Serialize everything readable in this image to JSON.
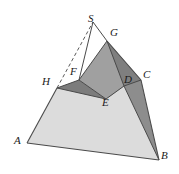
{
  "figure": {
    "type": "geometry-diagram",
    "background_color": "#ffffff",
    "stroke_color": "#4a4a4a",
    "label_color": "#1a1a1a",
    "face_colors": {
      "front_light": "#dcdcdc",
      "right_dark": "#8e8e8e",
      "upper_mid": "#9e9e9e",
      "cut_mid_dark": "#848484",
      "cut_left_dark": "#767676"
    },
    "labels": [
      {
        "id": "S",
        "text": "S",
        "x": 88,
        "y": 13
      },
      {
        "id": "G",
        "text": "G",
        "x": 110,
        "y": 27
      },
      {
        "id": "C",
        "text": "C",
        "x": 143,
        "y": 69
      },
      {
        "id": "D",
        "text": "D",
        "x": 124,
        "y": 74
      },
      {
        "id": "F",
        "text": "F",
        "x": 70,
        "y": 66
      },
      {
        "id": "H",
        "text": "H",
        "x": 42,
        "y": 76
      },
      {
        "id": "E",
        "text": "E",
        "x": 102,
        "y": 97
      },
      {
        "id": "A",
        "text": "A",
        "x": 14,
        "y": 135
      },
      {
        "id": "B",
        "text": "B",
        "x": 161,
        "y": 150
      }
    ],
    "points": {
      "S": [
        93,
        22
      ],
      "G": [
        107,
        41
      ],
      "C": [
        141,
        80
      ],
      "D": [
        124,
        86
      ],
      "F": [
        79,
        80
      ],
      "H": [
        57,
        88
      ],
      "E": [
        106,
        99
      ],
      "A": [
        27,
        143
      ],
      "B": [
        159,
        160
      ]
    },
    "faces": [
      {
        "name": "front-face-A-H-E-D-B",
        "fill": "#dcdcdc",
        "points": "27,143 57,88 79,80 106,99 124,86 159,160"
      },
      {
        "name": "right-face-C-D-B",
        "fill": "#8e8e8e",
        "points": "141,80 124,86 106,99 124,86 159,160"
      },
      {
        "name": "right-face-G-C-B",
        "fill": "#8a8a8a",
        "points": "107,41 141,80 159,160 124,86"
      },
      {
        "name": "upper-face-G-F-E-D",
        "fill": "#9e9e9e",
        "points": "107,41 79,80 106,99 124,86"
      },
      {
        "name": "cut-face-H-F-E",
        "fill": "#7d7d7d",
        "points": "57,88 79,80 106,99"
      }
    ],
    "edges": [
      {
        "name": "edge-A-B",
        "from": "A",
        "to": "B",
        "style": "solid"
      },
      {
        "name": "edge-A-H",
        "from": "A",
        "to": "H",
        "style": "solid"
      },
      {
        "name": "edge-H-S",
        "from": "H",
        "to": "S",
        "style": "dashed"
      },
      {
        "name": "edge-S-G",
        "from": "S",
        "to": "G",
        "style": "solid"
      },
      {
        "name": "edge-S-F",
        "from": "S",
        "to": "F",
        "style": "solid"
      },
      {
        "name": "edge-G-C",
        "from": "G",
        "to": "C",
        "style": "solid"
      },
      {
        "name": "edge-C-B",
        "from": "C",
        "to": "B",
        "style": "solid"
      },
      {
        "name": "edge-G-D",
        "from": "G",
        "to": "D",
        "style": "solid"
      },
      {
        "name": "edge-D-B",
        "from": "D",
        "to": "B",
        "style": "solid"
      },
      {
        "name": "edge-H-F",
        "from": "H",
        "to": "F",
        "style": "solid"
      },
      {
        "name": "edge-F-G",
        "from": "F",
        "to": "G",
        "style": "solid"
      },
      {
        "name": "edge-H-E",
        "from": "H",
        "to": "E",
        "style": "solid"
      },
      {
        "name": "edge-F-E",
        "from": "F",
        "to": "E",
        "style": "solid"
      },
      {
        "name": "edge-E-D",
        "from": "E",
        "to": "D",
        "style": "solid"
      },
      {
        "name": "edge-C-D",
        "from": "C",
        "to": "D",
        "style": "solid"
      }
    ]
  }
}
